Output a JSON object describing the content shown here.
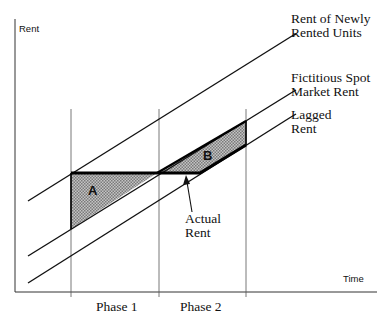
{
  "diagram": {
    "y_axis_label": "Rent",
    "x_axis_label": "Time",
    "lines": [
      {
        "name": "rent-newly-rented-line",
        "label_line1": "Rent of Newly",
        "label_line2": "Rented Units"
      },
      {
        "name": "spot-market-rent-line",
        "label_line1": "Fictitious Spot",
        "label_line2": "Market Rent"
      },
      {
        "name": "lagged-rent-line",
        "label_line1": "Lagged",
        "label_line2": "Rent"
      }
    ],
    "actual_rent": {
      "label_line1": "Actual",
      "label_line2": "Rent"
    },
    "regions": {
      "a": "A",
      "b": "B"
    },
    "phases": [
      "Phase 1",
      "Phase 2"
    ],
    "colors": {
      "line": "#111111",
      "fill": "#b0b0b0",
      "guide": "#555555"
    }
  }
}
